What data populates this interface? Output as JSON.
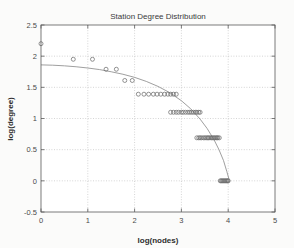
{
  "chart_data": {
    "type": "scatter",
    "title": "Station Degree Distribution",
    "xlabel": "log(nodes)",
    "ylabel": "log(degree)",
    "xlim": [
      0,
      5
    ],
    "ylim": [
      -0.5,
      2.5
    ],
    "xticks": [
      0,
      1,
      2,
      3,
      4,
      5
    ],
    "xticklabels": [
      "0",
      "1",
      "2",
      "3",
      "4",
      "5"
    ],
    "yticks": [
      -0.5,
      0,
      0.5,
      1,
      1.5,
      2,
      2.5
    ],
    "yticklabels": [
      "-0.5",
      "0",
      "0.5",
      "1",
      "1.5",
      "2",
      "2.5"
    ],
    "grid": true,
    "legend": null,
    "marker": "circle-open",
    "marker_color": "#6e6e6e",
    "curve_color": "#8e8e8e",
    "background_color": "#fbfbfa",
    "axis_color": "#5a5a5a",
    "series": [
      {
        "name": "station degree",
        "x": [
          0.0,
          0.69,
          1.1,
          1.39,
          1.61,
          1.79,
          1.95,
          2.08,
          2.2,
          2.3,
          2.4,
          2.48,
          2.56,
          2.64,
          2.71,
          2.77,
          2.83,
          2.89,
          2.77,
          2.83,
          2.89,
          2.94,
          3.0,
          3.04,
          3.09,
          3.14,
          3.18,
          3.22,
          3.26,
          3.3,
          3.33,
          3.37,
          3.4,
          3.33,
          3.37,
          3.4,
          3.43,
          3.47,
          3.5,
          3.53,
          3.56,
          3.58,
          3.61,
          3.64,
          3.66,
          3.69,
          3.71,
          3.74,
          3.76,
          3.78,
          3.81,
          3.83,
          3.85,
          3.87,
          3.89,
          3.91,
          3.93,
          3.95,
          3.97,
          3.99,
          4.0
        ],
        "y": [
          2.2,
          1.95,
          1.95,
          1.79,
          1.79,
          1.61,
          1.61,
          1.39,
          1.39,
          1.39,
          1.39,
          1.39,
          1.39,
          1.39,
          1.39,
          1.39,
          1.39,
          1.39,
          1.1,
          1.1,
          1.1,
          1.1,
          1.1,
          1.1,
          1.1,
          1.1,
          1.1,
          1.1,
          1.1,
          1.1,
          1.1,
          1.1,
          1.1,
          0.69,
          0.69,
          0.69,
          0.69,
          0.69,
          0.69,
          0.69,
          0.69,
          0.69,
          0.69,
          0.69,
          0.69,
          0.69,
          0.69,
          0.69,
          0.69,
          0.69,
          0.69,
          0.0,
          0.0,
          0.0,
          0.0,
          0.0,
          0.0,
          0.0,
          0.0,
          0.0,
          0.0
        ]
      }
    ],
    "fit_curve": {
      "name": "fitted trend",
      "x": [
        0.0,
        0.25,
        0.5,
        0.75,
        1.0,
        1.25,
        1.5,
        1.75,
        2.0,
        2.25,
        2.5,
        2.75,
        3.0,
        3.2,
        3.4,
        3.55,
        3.7,
        3.8,
        3.9,
        3.97,
        4.02
      ],
      "y": [
        1.86,
        1.855,
        1.845,
        1.83,
        1.81,
        1.785,
        1.75,
        1.71,
        1.66,
        1.595,
        1.515,
        1.415,
        1.285,
        1.155,
        0.99,
        0.84,
        0.655,
        0.505,
        0.325,
        0.15,
        0.02
      ]
    }
  }
}
